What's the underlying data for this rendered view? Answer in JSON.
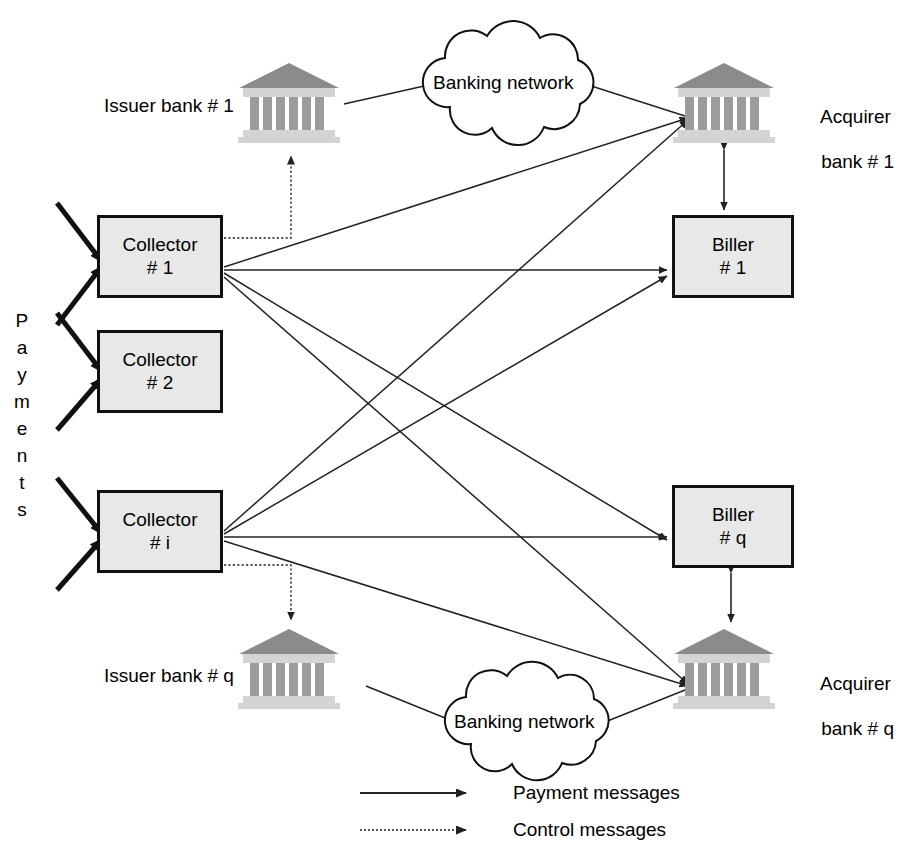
{
  "diagram": {
    "colors": {
      "box_fill": "#e8e8e8",
      "box_border": "#111111",
      "line": "#222222",
      "bank_roof": "#8f8f8f",
      "bank_column": "#9a9a9a",
      "bank_base": "#d2d2d2",
      "background": "#ffffff"
    },
    "nodes": {
      "collector1": {
        "line1": "Collector",
        "line2": "# 1",
        "x": 97,
        "y": 215,
        "w": 126,
        "h": 83
      },
      "collector2": {
        "line1": "Collector",
        "line2": "# 2",
        "x": 97,
        "y": 330,
        "w": 126,
        "h": 83
      },
      "collectori": {
        "line1": "Collector",
        "line2": "# i",
        "x": 97,
        "y": 490,
        "w": 126,
        "h": 83
      },
      "biller1": {
        "line1": "Biller",
        "line2": "# 1",
        "x": 672,
        "y": 215,
        "w": 122,
        "h": 83
      },
      "billerq": {
        "line1": "Biller",
        "line2": "# q",
        "x": 672,
        "y": 485,
        "w": 122,
        "h": 83
      }
    },
    "banks": {
      "issuer1": {
        "label": "Issuer bank # 1",
        "x": 237,
        "y": 61,
        "w": 104,
        "h": 84
      },
      "issuerq": {
        "label": "Issuer bank # q",
        "x": 237,
        "y": 627,
        "w": 104,
        "h": 84
      },
      "acquirer1": {
        "label_line1": "Acquirer",
        "label_line2": "bank # 1",
        "x": 672,
        "y": 61,
        "w": 104,
        "h": 84
      },
      "acquirerq": {
        "label_line1": "Acquirer",
        "label_line2": "bank # q",
        "x": 672,
        "y": 627,
        "w": 104,
        "h": 84
      }
    },
    "clouds": {
      "top": {
        "label": "Banking network",
        "cx": 508,
        "cy": 85
      },
      "bottom": {
        "label": "Banking network",
        "cx": 528,
        "cy": 723
      }
    },
    "side_label": {
      "text": "Payments",
      "letters": [
        "P",
        "a",
        "y",
        "m",
        "e",
        "n",
        "t",
        "s"
      ]
    },
    "legend": {
      "items": [
        {
          "style": "solid",
          "label": "Payment messages"
        },
        {
          "style": "dotted",
          "label": "Control messages"
        }
      ]
    }
  }
}
